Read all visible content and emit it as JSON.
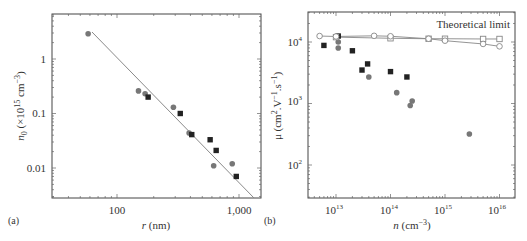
{
  "chart_data": [
    {
      "panel": "(a)",
      "type": "scatter",
      "xlabel": "r (nm)",
      "ylabel": "n0 (×10^15 cm^-3)",
      "xscale": "log",
      "yscale": "log",
      "xlim": [
        30,
        1500
      ],
      "ylim": [
        0.003,
        6
      ],
      "xticks": [
        "100",
        "1,000"
      ],
      "yticks": [
        "1",
        "0.1",
        "0.01"
      ],
      "series": [
        {
          "name": "circles",
          "marker": "circle",
          "color": "#777777",
          "x": [
            58,
            150,
            170,
            290,
            390,
            620,
            880
          ],
          "y": [
            2.9,
            0.26,
            0.23,
            0.13,
            0.044,
            0.011,
            0.012
          ]
        },
        {
          "name": "squares",
          "marker": "square",
          "color": "#222222",
          "x": [
            180,
            330,
            410,
            580,
            650,
            950
          ],
          "y": [
            0.2,
            0.1,
            0.041,
            0.033,
            0.021,
            0.007
          ]
        },
        {
          "name": "fit",
          "marker": "line",
          "color": "#888888",
          "x": [
            60,
            1100
          ],
          "y": [
            3.1,
            0.006
          ]
        }
      ]
    },
    {
      "panel": "(b)",
      "type": "scatter",
      "xlabel": "n (cm^-3)",
      "ylabel": "μ (cm^2.V^-1.s^-1)",
      "xscale": "log",
      "yscale": "log",
      "xlim": [
        3000000000000.0,
        2e+16
      ],
      "ylim": [
        30,
        30000
      ],
      "xticks": [
        "10^13",
        "10^14",
        "10^15",
        "10^16"
      ],
      "yticks": [
        "10^4",
        "10^3",
        "10^2"
      ],
      "annotation": "Theoretical limit",
      "series": [
        {
          "name": "squares",
          "marker": "square",
          "color": "#222222",
          "x": [
            6000000000000.0,
            11000000000000.0,
            20000000000000.0,
            30000000000000.0,
            38000000000000.0,
            100000000000000.0,
            200000000000000.0
          ],
          "y": [
            8800,
            12500,
            7200,
            3500,
            4400,
            3300,
            2700
          ]
        },
        {
          "name": "circles",
          "marker": "circle",
          "color": "#777777",
          "x": [
            11000000000000.0,
            11000000000000.0,
            40000000000000.0,
            130000000000000.0,
            230000000000000.0,
            250000000000000.0,
            2800000000000000.0
          ],
          "y": [
            10000,
            8000,
            2700,
            1500,
            930,
            1100,
            320
          ]
        },
        {
          "name": "Theoretical limit (squares)",
          "marker": "open-square",
          "color": "#888888",
          "x": [
            10000000000000.0,
            100000000000000.0,
            500000000000000.0,
            1000000000000000.0,
            5000000000000000.0,
            1e+16
          ],
          "y": [
            12000,
            11500,
            11300,
            11300,
            11200,
            11200
          ]
        },
        {
          "name": "Theoretical limit (circles)",
          "marker": "open-circle",
          "color": "#888888",
          "x": [
            5000000000000.0,
            10000000000000.0,
            50000000000000.0,
            100000000000000.0,
            500000000000000.0,
            1000000000000000.0,
            5000000000000000.0,
            1e+16
          ],
          "y": [
            12500,
            12300,
            12600,
            12400,
            11300,
            10500,
            9300,
            8500
          ]
        }
      ]
    }
  ],
  "panel_a": {
    "label": "(a)",
    "xlabel_var": "r",
    "xlabel_unit": " (nm)",
    "ylabel_var": "n",
    "ylabel_sub": "0",
    "ylabel_rest": " (×10",
    "ylabel_exp": "15",
    "ylabel_unit": " cm",
    "ylabel_unit_exp": "−3",
    "ylabel_close": ")",
    "xticks": [
      "100",
      "1,000"
    ],
    "yticks": [
      "1",
      "0.1",
      "0.01"
    ]
  },
  "panel_b": {
    "label": "(b)",
    "xlabel_var": "n",
    "xlabel_unit": " (cm",
    "xlabel_exp": "−3",
    "xlabel_close": ")",
    "ylabel": "μ (cm",
    "ylabel_e1": "2",
    "ylabel_m": ".V",
    "ylabel_e2": "−1",
    "ylabel_s": ".s",
    "ylabel_e3": "−1",
    "ylabel_close": ")",
    "xtick_base": "10",
    "xtick_exps": [
      "13",
      "14",
      "15",
      "16"
    ],
    "ytick_base": "10",
    "ytick_exps": [
      "4",
      "3",
      "2"
    ],
    "annotation": "Theoretical limit"
  }
}
